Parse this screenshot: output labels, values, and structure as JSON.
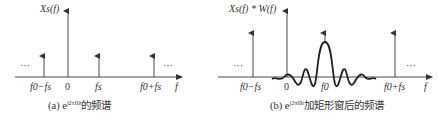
{
  "panel_a": {
    "ylabel": "Xs(f)",
    "ticks": [
      "f0−fs",
      "0",
      "fs",
      "f0+fs",
      "f"
    ],
    "caption_prefix": "(a) e",
    "caption_sup": "j2πf0t",
    "caption_suffix": "的频谱",
    "ellipsis": "···"
  },
  "panel_b": {
    "ylabel": "Xs(f) * W(f)",
    "ticks": [
      "f0−fs",
      "0",
      "f0",
      "f0+fs",
      "f"
    ],
    "caption_prefix": "(b) e",
    "caption_sup": "j2πf0t",
    "caption_suffix": "加矩形窗后的频谱",
    "ellipsis": "···"
  },
  "colors": {
    "stroke": "#333333",
    "background": "#ffffff"
  }
}
